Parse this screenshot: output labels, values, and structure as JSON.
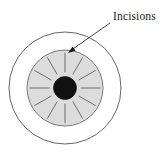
{
  "figure": {
    "name": "radial-keratotomy-incisions-diagram",
    "background_color": "#ffffff",
    "width": 165,
    "height": 154
  },
  "annotation": {
    "label": "Incisions",
    "label_x": 113,
    "label_y": 20,
    "leader_line": {
      "from_x": 110,
      "from_y": 23,
      "to_x": 70,
      "to_y": 51
    },
    "arrowhead": {
      "x": 68,
      "y": 53
    },
    "color": "#2b2b2b"
  },
  "eye": {
    "center_x": 65,
    "center_y": 88,
    "outer_circle": {
      "name": "sclera-outline",
      "radius": 56,
      "stroke": "#555555",
      "stroke_width": 0.9,
      "fill": "none"
    },
    "iris": {
      "name": "iris-cornea",
      "radius": 38,
      "fill": "#dcdcdc",
      "stroke": "#6a6a6a",
      "stroke_width": 0.9
    },
    "pupil": {
      "name": "pupil",
      "radius": 11.5,
      "fill": "#111111",
      "stroke": "#111111"
    }
  },
  "incisions": {
    "count": 12,
    "inner_radius": 16,
    "outer_radius": 35,
    "stroke": "#6e6e6e",
    "stroke_width": 1.0,
    "angles_deg": [
      0,
      30,
      60,
      90,
      120,
      150,
      180,
      210,
      240,
      270,
      300,
      330
    ]
  }
}
